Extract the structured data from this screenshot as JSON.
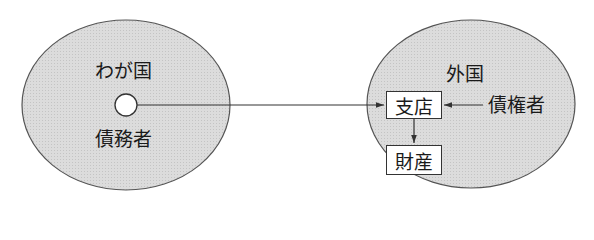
{
  "diagram": {
    "left_region": {
      "label": "わが国",
      "entity": "債務者",
      "fill": "#d9d9d9"
    },
    "right_region": {
      "label": "外国",
      "fill": "#d9d9d9"
    },
    "nodes": {
      "branch": "支店",
      "property": "財産",
      "creditor": "債権者"
    },
    "edges": [
      {
        "from": "債務者",
        "to": "支店"
      },
      {
        "from": "債権者",
        "to": "支店"
      },
      {
        "from": "支店",
        "to": "財産"
      }
    ]
  }
}
